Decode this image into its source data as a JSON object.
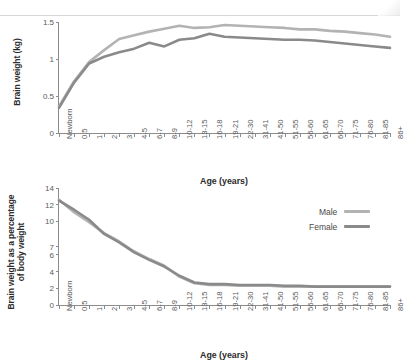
{
  "figure": {
    "legend": {
      "position": "middle-right",
      "items": [
        {
          "label": "Male",
          "color": "#b3b3b3"
        },
        {
          "label": "Female",
          "color": "#8a8a8a"
        }
      ]
    }
  },
  "chart_data": [
    {
      "id": "brain-weight-kg",
      "type": "line",
      "title": "",
      "xlabel": "Age (years)",
      "ylabel": "Brain weight (kg)",
      "grid": false,
      "legend_position": "none",
      "ylim": [
        0,
        1.5
      ],
      "yticks": [
        0,
        0.5,
        1,
        1.5
      ],
      "ytick_labels": [
        "0",
        "0.5",
        "1",
        "1.5"
      ],
      "categories": [
        "Newborn",
        "0.5",
        "1",
        "2",
        "3",
        "4-5",
        "6-7",
        "8-9",
        "10-12",
        "13-15",
        "16-18",
        "19-21",
        "22-30",
        "31-41",
        "41-50",
        "51-55",
        "56-60",
        "61-65",
        "66-70",
        "71-75",
        "76-80",
        "81-85",
        "86+"
      ],
      "series": [
        {
          "name": "Male",
          "color": "#b3b3b3",
          "values": [
            0.36,
            0.7,
            0.96,
            1.12,
            1.27,
            1.32,
            1.37,
            1.41,
            1.45,
            1.42,
            1.43,
            1.46,
            1.45,
            1.44,
            1.43,
            1.42,
            1.4,
            1.4,
            1.38,
            1.37,
            1.35,
            1.33,
            1.3
          ]
        },
        {
          "name": "Female",
          "color": "#8a8a8a",
          "values": [
            0.34,
            0.68,
            0.94,
            1.03,
            1.09,
            1.14,
            1.22,
            1.17,
            1.26,
            1.28,
            1.34,
            1.3,
            1.29,
            1.28,
            1.27,
            1.26,
            1.26,
            1.25,
            1.23,
            1.21,
            1.19,
            1.17,
            1.15
          ]
        }
      ]
    },
    {
      "id": "brain-weight-percent-body",
      "type": "line",
      "title": "",
      "xlabel": "Age (years)",
      "ylabel": "Brain weight as a percentage of body weight",
      "grid": false,
      "legend_position": "middle-right",
      "ylim": [
        0,
        14
      ],
      "yticks": [
        0,
        2,
        4,
        6,
        7,
        10,
        12,
        14
      ],
      "ytick_labels": [
        "0",
        "2",
        "4",
        "6",
        "7",
        "10",
        "12",
        "14"
      ],
      "categories": [
        "Newborn",
        "0.5",
        "1",
        "2",
        "3",
        "4-5",
        "6-7",
        "8-9",
        "10-12",
        "13-15",
        "16-18",
        "19-21",
        "22-30",
        "31-41",
        "41-50",
        "51-55",
        "56-60",
        "61-65",
        "66-70",
        "71-75",
        "76-80",
        "81-85",
        "86+"
      ],
      "series": [
        {
          "name": "Male",
          "color": "#b3b3b3",
          "values": [
            12.6,
            11.1,
            9.9,
            8.6,
            7.6,
            6.4,
            5.5,
            4.7,
            3.4,
            2.6,
            2.4,
            2.4,
            2.3,
            2.3,
            2.3,
            2.2,
            2.2,
            2.2,
            2.2,
            2.2,
            2.2,
            2.2,
            2.2
          ]
        },
        {
          "name": "Female",
          "color": "#8a8a8a",
          "values": [
            12.5,
            11.4,
            10.2,
            8.5,
            7.5,
            6.3,
            5.4,
            4.6,
            3.5,
            2.7,
            2.5,
            2.5,
            2.4,
            2.4,
            2.4,
            2.3,
            2.3,
            2.2,
            2.2,
            2.2,
            2.2,
            2.2,
            2.2
          ]
        }
      ]
    }
  ]
}
